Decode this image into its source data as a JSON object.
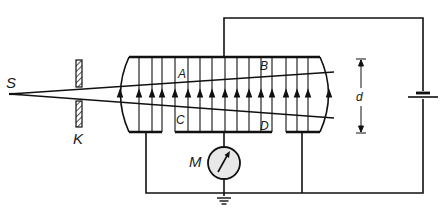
{
  "diagram": {
    "colors": {
      "ink": "#111111",
      "background": "#ffffff",
      "meter_fill": "#e8e8e8"
    },
    "labels": {
      "source": "S",
      "collimator": "K",
      "point_a": "A",
      "point_b": "B",
      "point_c": "C",
      "point_d": "D",
      "meter": "M",
      "distance": "d"
    },
    "components": [
      {
        "id": "source",
        "label": "S",
        "description": "ion source / point emitter"
      },
      {
        "id": "collimator",
        "label": "K",
        "description": "hatched collimator slit plate"
      },
      {
        "id": "capacitor",
        "description": "parallel plate chamber with upward field lines"
      },
      {
        "id": "meter",
        "label": "M",
        "description": "electrometer with needle, grounded"
      },
      {
        "id": "battery",
        "description": "DC voltage source on right"
      },
      {
        "id": "ground",
        "description": "earth symbol below meter"
      }
    ],
    "field_arrow_count": 17
  }
}
